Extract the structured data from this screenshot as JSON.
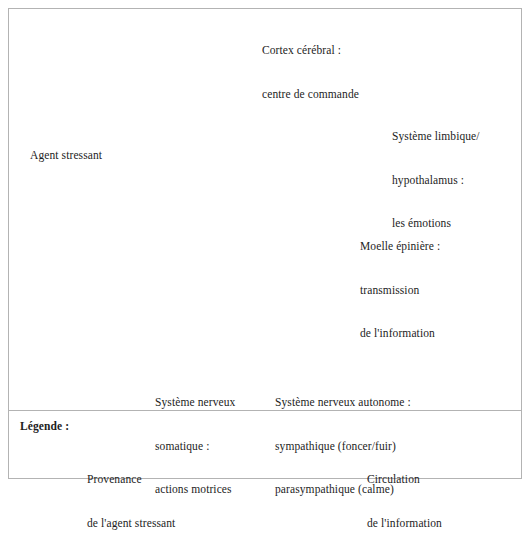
{
  "figure": {
    "title_present": false,
    "colors": {
      "frame": "#b3b3b3",
      "text": "#1d1d1d",
      "silhouette": "#c4c4c4",
      "skull": "#d8d8d8",
      "brain_light": "#cfcfcf",
      "brain_mid": "#9a9a9a",
      "brain_dark": "#5c5c5c",
      "arrow": "#111111"
    }
  },
  "labels": {
    "cortex": {
      "name": "cortex-label",
      "line1": "Cortex cérébral :",
      "line2": "centre de commande"
    },
    "limbic": {
      "name": "limbic-label",
      "line1": "Système limbique/",
      "line2": "hypothalamus :",
      "line3": "les émotions"
    },
    "stressor": {
      "name": "stressor-label",
      "line1": "Agent stressant"
    },
    "spinal_cord": {
      "name": "spinal-cord-label",
      "line1": "Moelle épinière :",
      "line2": "transmission",
      "line3": "de l'information"
    },
    "somatic": {
      "name": "somatic-label",
      "line1": "Système nerveux",
      "line2": "somatique :",
      "line3": "actions motrices"
    },
    "autonomic": {
      "name": "autonomic-label",
      "line1": "Système nerveux autonome :",
      "line2": "sympathique (foncer/fuir)",
      "line3": "parasympathique (calme)"
    }
  },
  "legend": {
    "title": "Légende :",
    "entries": [
      {
        "icon": "single-headed-arrow-right",
        "line1": "Provenance",
        "line2": "de l'agent stressant"
      },
      {
        "icon": "triple-double-headed-arrow",
        "line1": "Circulation",
        "line2": "de l'information"
      }
    ]
  },
  "illustration": {
    "name": "sagittal-head-brain-spine-diagram",
    "description": "Grayscale mid-sagittal section of a human head showing cerebral cortex, corpus callosum, limbic structures, brainstem, cerebellum and the cervical spinal column, with double-headed arrows along the spinal cord that branch into two diverging chains.",
    "arrow_chains": {
      "spinal_columns": 2,
      "branches": 2
    }
  }
}
